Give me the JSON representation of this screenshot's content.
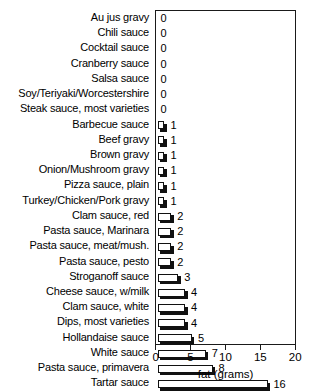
{
  "chart_data": {
    "type": "bar",
    "orientation": "horizontal",
    "title": "",
    "xlabel": "fat (grams)",
    "ylabel": "",
    "xlim": [
      0,
      20
    ],
    "xticks": [
      0,
      5,
      10,
      15,
      20
    ],
    "grid": false,
    "legend": false,
    "categories": [
      "Au jus gravy",
      "Chili sauce",
      "Cocktail sauce",
      "Cranberry sauce",
      "Salsa sauce",
      "Soy/Teriyaki/Worcestershire",
      "Steak sauce, most varieties",
      "Barbecue sauce",
      "Beef gravy",
      "Brown gravy",
      "Onion/Mushroom gravy",
      "Pizza sauce, plain",
      "Turkey/Chicken/Pork gravy",
      "Clam sauce, red",
      "Pasta sauce, Marinara",
      "Pasta sauce, meat/mush.",
      "Pasta sauce, pesto",
      "Stroganoff sauce",
      "Cheese sauce, w/milk",
      "Clam sauce, white",
      "Dips, most varieties",
      "Hollandaise sauce",
      "White sauce",
      "Pasta sauce, primavera",
      "Tartar sauce"
    ],
    "values": [
      0,
      0,
      0,
      0,
      0,
      0,
      0,
      1,
      1,
      1,
      1,
      1,
      1,
      2,
      2,
      2,
      2,
      3,
      4,
      4,
      4,
      5,
      7,
      8,
      16
    ],
    "value_labels": [
      "0",
      "0",
      "0",
      "0",
      "0",
      "0",
      "0",
      "1",
      "1",
      "1",
      "1",
      "1",
      "1",
      "2",
      "2",
      "2",
      "2",
      "3",
      "4",
      "4",
      "4",
      "5",
      "7",
      "8",
      "16"
    ]
  },
  "colors": {
    "bar_fill": "#ffffff",
    "bar_outline": "#111111",
    "bar_shadow": "#111111",
    "axis": "#1a1a1a",
    "text": "#000000",
    "background": "#ffffff"
  }
}
